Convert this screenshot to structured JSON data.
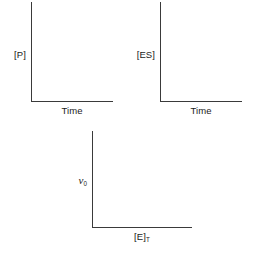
{
  "figure": {
    "caption": "",
    "background_color": "#ffffff",
    "axis_color": "#3a3a3a",
    "text_color": "#1a1a1a"
  },
  "panels": [
    {
      "id": "product",
      "ylabel": "[P]",
      "xlabel": "Time",
      "ylabel_style": "bracket",
      "xlabel_style": "plain"
    },
    {
      "id": "es",
      "ylabel": "[ES]",
      "xlabel": "Time",
      "ylabel_style": "bracket",
      "xlabel_style": "plain"
    },
    {
      "id": "rate",
      "ylabel_main": "v",
      "ylabel_sub": "0",
      "xlabel_main": "[E]",
      "xlabel_sub": "T",
      "ylabel_style": "italic-subscript",
      "xlabel_style": "bracket-subscript"
    }
  ],
  "chart_data": [
    {
      "type": "line",
      "title": "",
      "xlabel": "Time",
      "ylabel": "[P]",
      "x": [],
      "values": [],
      "series": [],
      "xticks": [],
      "yticks": [],
      "xlim": [
        0,
        1
      ],
      "ylim": [
        0,
        1
      ],
      "grid": false,
      "legend": false,
      "notes": "Blank axes template - no data plotted; product concentration versus time"
    },
    {
      "type": "line",
      "title": "",
      "xlabel": "Time",
      "ylabel": "[ES]",
      "x": [],
      "values": [],
      "series": [],
      "xticks": [],
      "yticks": [],
      "xlim": [
        0,
        1
      ],
      "ylim": [
        0,
        1
      ],
      "grid": false,
      "legend": false,
      "notes": "Blank axes template - no data plotted; enzyme-substrate complex concentration versus time"
    },
    {
      "type": "line",
      "title": "",
      "xlabel": "[E]T",
      "ylabel": "v0",
      "x": [],
      "values": [],
      "series": [],
      "xticks": [],
      "yticks": [],
      "xlim": [
        0,
        1
      ],
      "ylim": [
        0,
        1
      ],
      "grid": false,
      "legend": false,
      "notes": "Blank axes template - no data plotted; initial velocity versus total enzyme concentration"
    }
  ]
}
